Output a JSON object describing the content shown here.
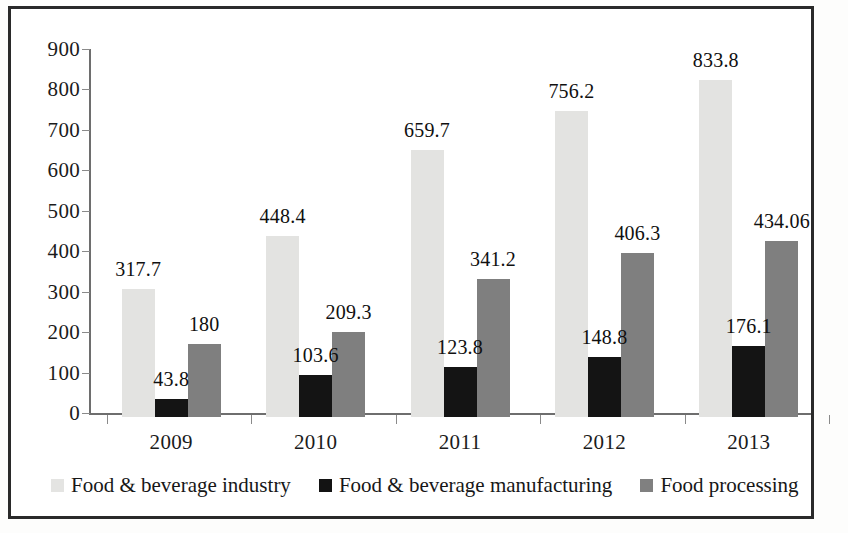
{
  "chart_data": {
    "type": "bar",
    "title": "",
    "subtitle": "",
    "xlabel": "",
    "ylabel": "",
    "categories": [
      "2009",
      "2010",
      "2011",
      "2012",
      "2013"
    ],
    "ylim": [
      0,
      900
    ],
    "yticks": [
      0,
      100,
      200,
      300,
      400,
      500,
      600,
      700,
      800,
      900
    ],
    "ytick_labels": [
      "0",
      "100",
      "200",
      "300",
      "400",
      "500",
      "600",
      "700",
      "800",
      "900"
    ],
    "grid": false,
    "legend_position": "bottom",
    "series": [
      {
        "name": "Food & beverage industry",
        "color": "#e3e3e1",
        "values": [
          317.7,
          448.4,
          659.7,
          756.2,
          833.8
        ],
        "labels": [
          "317.7",
          "448.4",
          "659.7",
          "756.2",
          "833.8"
        ]
      },
      {
        "name": "Food & beverage manufacturing",
        "color": "#141414",
        "values": [
          43.8,
          103.6,
          123.8,
          148.8,
          176.1
        ],
        "labels": [
          "43.8",
          "103.6",
          "123.8",
          "148.8",
          "176.1"
        ]
      },
      {
        "name": "Food processing",
        "color": "#7f7f7f",
        "values": [
          180,
          209.3,
          341.2,
          406.3,
          434.06
        ],
        "labels": [
          "180",
          "209.3",
          "341.2",
          "406.3",
          "434.06"
        ]
      }
    ]
  },
  "legend": {
    "items": [
      {
        "label": "Food & beverage industry",
        "swatch": "s0"
      },
      {
        "label": "Food & beverage manufacturing",
        "swatch": "s1"
      },
      {
        "label": "Food processing",
        "swatch": "s2"
      }
    ]
  }
}
